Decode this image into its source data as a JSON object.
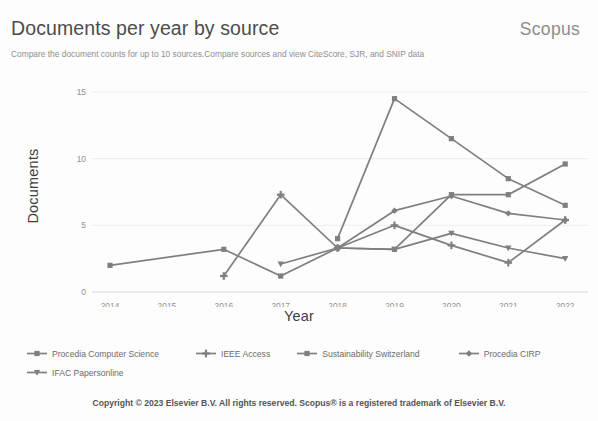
{
  "header": {
    "title": "Documents per year by source",
    "brand": "Scopus",
    "subtitle": "Compare the document counts for up to 10 sources.Compare sources and view CiteScore, SJR, and SNIP data"
  },
  "footer": {
    "copyright": "Copyright © 2023 Elsevier B.V. All rights reserved. Scopus® is a registered trademark of Elsevier B.V."
  },
  "colors": {
    "line": "#7f7f7f",
    "line_dark": "#6e6e6e",
    "grid": "#ededed",
    "axis": "#d9d9d9",
    "tick_text": "#909090",
    "title_text": "#4c4c4c",
    "brand_text": "#8c8c8c",
    "subtitle_text": "#8f8f8f"
  },
  "chart_data": {
    "type": "line",
    "title": "Documents per year by source",
    "xlabel": "Year",
    "ylabel": "Documents",
    "categories": [
      2014,
      2015,
      2016,
      2017,
      2018,
      2019,
      2020,
      2021,
      2022
    ],
    "xtick_labels": [
      "2014",
      "2015",
      "2016",
      "2017",
      "2018",
      "2019",
      "2020",
      "2021",
      "2022"
    ],
    "ytick_labels": [
      "0",
      "5",
      "10",
      "15"
    ],
    "yticks": [
      0,
      5,
      10,
      15
    ],
    "ylim": [
      0,
      15
    ],
    "grid": true,
    "legend_position": "bottom-left",
    "series": [
      {
        "name": "Procedia Computer Science",
        "marker": "square",
        "color": "#7f7f7f",
        "values": [
          2,
          null,
          3.2,
          1.2,
          3.3,
          3.2,
          7.3,
          7.3,
          9.6
        ]
      },
      {
        "name": "IEEE Access",
        "marker": "plus",
        "color": "#7f7f7f",
        "values": [
          null,
          null,
          1.2,
          7.3,
          3.3,
          5.0,
          3.5,
          2.2,
          5.4
        ]
      },
      {
        "name": "Sustainability Switzerland",
        "marker": "square",
        "color": "#7f7f7f",
        "values": [
          null,
          null,
          null,
          null,
          4.0,
          14.5,
          11.5,
          8.5,
          6.5
        ]
      },
      {
        "name": "Procedia CIRP",
        "marker": "diamond",
        "color": "#7f7f7f",
        "values": [
          null,
          null,
          null,
          null,
          3.3,
          6.1,
          7.2,
          5.9,
          5.4
        ]
      },
      {
        "name": "IFAC Papersonline",
        "marker": "triangle",
        "color": "#7f7f7f",
        "values": [
          null,
          null,
          null,
          2.1,
          3.3,
          3.2,
          4.4,
          3.3,
          2.5
        ]
      }
    ]
  }
}
